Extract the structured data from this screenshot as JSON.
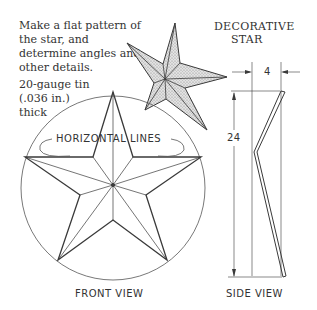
{
  "instructions": {
    "line1": "Make a flat pattern of the star, and determine angles and other details.",
    "line2": "20-gauge tin (.036 in.) thick"
  },
  "title": {
    "line1": "DECORATIVE",
    "line2": "STAR"
  },
  "front_view": {
    "label": "FRONT VIEW",
    "callout": "HORIZONTAL LINES"
  },
  "side_view": {
    "label": "SIDE VIEW",
    "dim_width": "4",
    "dim_height": "24"
  },
  "colors": {
    "line": "#3a3a3a",
    "shade": "#c8c8c8",
    "text": "#333333"
  }
}
